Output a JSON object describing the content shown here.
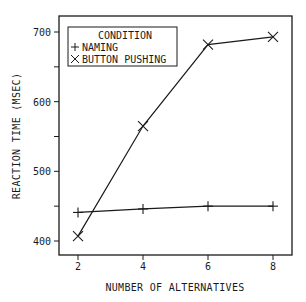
{
  "chart_data": {
    "type": "line",
    "title": "",
    "xlabel": "NUMBER OF ALTERNATIVES",
    "ylabel": "REACTION TIME (MSEC)",
    "x": [
      2,
      4,
      6,
      8
    ],
    "x_ticks": [
      "2",
      "4",
      "6",
      "8"
    ],
    "y_ticks": [
      "400",
      "500",
      "600",
      "700"
    ],
    "xlim": [
      1.4,
      8.6
    ],
    "ylim": [
      378,
      722
    ],
    "grid": false,
    "legend": {
      "title": "CONDITION",
      "position": "upper left",
      "entries": [
        {
          "marker": "+",
          "label": "NAMING"
        },
        {
          "marker": "×",
          "label": "BUTTON PUSHING"
        }
      ]
    },
    "series": [
      {
        "name": "NAMING",
        "marker": "plus",
        "values": [
          441,
          446,
          450,
          450
        ]
      },
      {
        "name": "BUTTON PUSHING",
        "marker": "x",
        "values": [
          407,
          565,
          682,
          693
        ]
      }
    ]
  }
}
